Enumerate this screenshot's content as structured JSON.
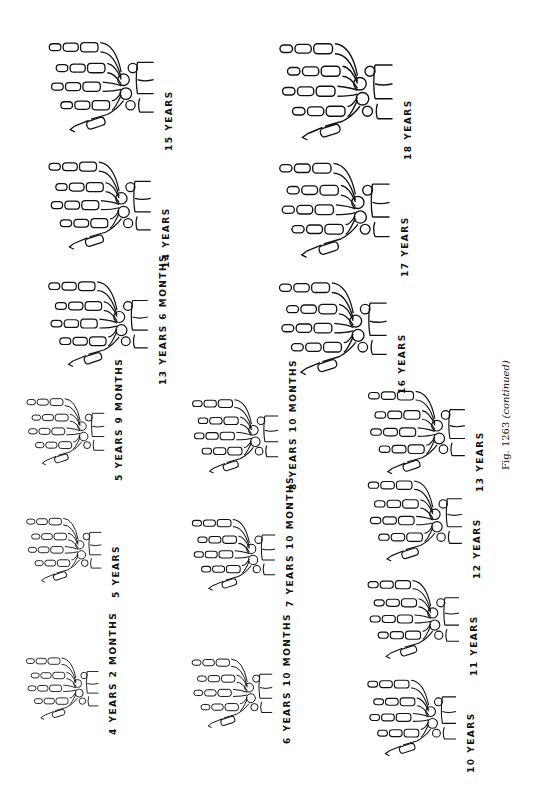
{
  "figure": {
    "caption_prefix": "Fig. 1263",
    "caption_suffix": "(continued)"
  },
  "panels": [
    {
      "id": "p1",
      "label": "4 YEARS  2 MONTHS"
    },
    {
      "id": "p2",
      "label": "5  YEARS"
    },
    {
      "id": "p3",
      "label": "5 YEARS  9  MONTHS"
    },
    {
      "id": "p4",
      "label": "6 YEARS  10 MONTHS"
    },
    {
      "id": "p5",
      "label": "7  YEARS  10  MONTHS"
    },
    {
      "id": "p6",
      "label": "8 YEARS  10 MONTHS"
    },
    {
      "id": "p7",
      "label": "10  YEARS"
    },
    {
      "id": "p8",
      "label": "11  YEARS"
    },
    {
      "id": "p9",
      "label": "12  YEARS"
    },
    {
      "id": "p10",
      "label": "13  YEARS"
    },
    {
      "id": "p11",
      "label": "13 YEARS  6 MONTHS"
    },
    {
      "id": "p12",
      "label": "14  YEARS"
    },
    {
      "id": "p13",
      "label": "15  YEARS"
    },
    {
      "id": "p14",
      "label": "16  YEARS"
    },
    {
      "id": "p15",
      "label": "17  YEARS"
    },
    {
      "id": "p16",
      "label": "18  YEARS"
    }
  ]
}
